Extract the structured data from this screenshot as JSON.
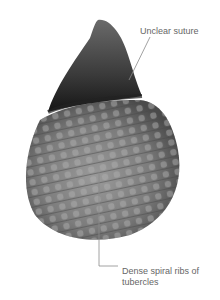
{
  "image": {
    "subject": "fossil-gastropod-shell"
  },
  "annotations": [
    {
      "label": "Unclear suture"
    },
    {
      "label": "Dense spiral ribs of tubercles"
    }
  ],
  "colors": {
    "leader_line": "#8a8a8a",
    "label_text": "#666666",
    "shell_mid": "#7a7a7a",
    "shell_dark": "#1e1e1e"
  }
}
